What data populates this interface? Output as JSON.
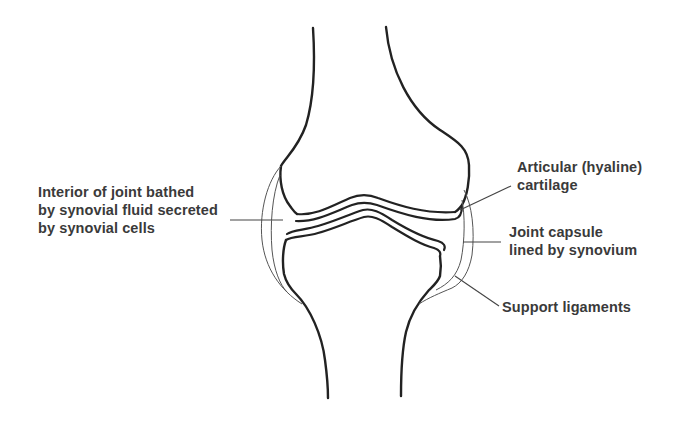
{
  "diagram": {
    "title": "",
    "labels": {
      "interior": {
        "lines": [
          "Interior of joint bathed",
          "by synovial fluid secreted",
          "by synovial cells"
        ]
      },
      "cartilage": {
        "lines": [
          "Articular (hyaline)",
          "cartilage"
        ]
      },
      "capsule": {
        "lines": [
          "Joint capsule",
          "lined by synovium"
        ]
      },
      "ligaments": {
        "lines": [
          "Support ligaments"
        ]
      }
    },
    "colors": {
      "background": "#ffffff",
      "line": "#222222",
      "text": "#3a3a3a"
    }
  }
}
